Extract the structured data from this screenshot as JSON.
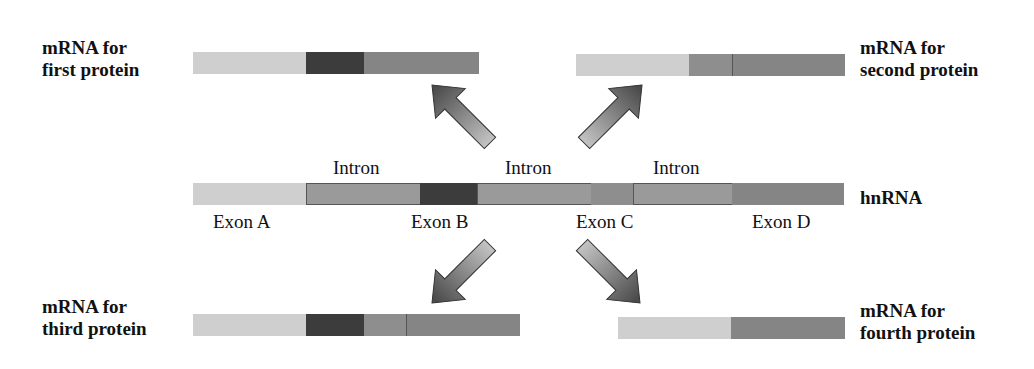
{
  "colors": {
    "exon_a": "#cfcfcf",
    "exon_b": "#3c3c3c",
    "exon_c": "#8e8e8e",
    "exon_d": "#858585",
    "intron": "#9a9a9a",
    "arrow_dark": "#4a4a4a",
    "arrow_light": "#bdbdbd"
  },
  "hnrna": {
    "label": "hnRNA",
    "intron_labels": [
      "Intron",
      "Intron",
      "Intron"
    ],
    "exon_labels": [
      "Exon A",
      "Exon B",
      "Exon C",
      "Exon D"
    ],
    "segments": [
      {
        "name": "exon-a",
        "x": 193,
        "w": 113,
        "color": "#cfcfcf"
      },
      {
        "name": "intron-1",
        "x": 306,
        "w": 114,
        "color": "#9a9a9a"
      },
      {
        "name": "exon-b",
        "x": 420,
        "w": 57,
        "color": "#3c3c3c"
      },
      {
        "name": "intron-2",
        "x": 477,
        "w": 114,
        "color": "#9a9a9a"
      },
      {
        "name": "exon-c",
        "x": 591,
        "w": 42,
        "color": "#8e8e8e"
      },
      {
        "name": "intron-3",
        "x": 633,
        "w": 99,
        "color": "#9a9a9a"
      },
      {
        "name": "exon-d",
        "x": 732,
        "w": 112,
        "color": "#858585"
      }
    ]
  },
  "mrnas": [
    {
      "id": "first",
      "label_line1": "mRNA for",
      "label_line2": "first protein",
      "exons": [
        "A",
        "B",
        "D"
      ],
      "segments": [
        {
          "x": 193,
          "w": 113,
          "color": "#cfcfcf"
        },
        {
          "x": 306,
          "w": 58,
          "color": "#3c3c3c"
        },
        {
          "x": 364,
          "w": 115,
          "color": "#858585"
        }
      ]
    },
    {
      "id": "second",
      "label_line1": "mRNA for",
      "label_line2": "second protein",
      "exons": [
        "A",
        "C",
        "D"
      ],
      "segments": [
        {
          "x": 576,
          "w": 113,
          "color": "#cfcfcf"
        },
        {
          "x": 689,
          "w": 44,
          "color": "#8e8e8e"
        },
        {
          "x": 733,
          "w": 112,
          "color": "#858585"
        }
      ]
    },
    {
      "id": "third",
      "label_line1": "mRNA for",
      "label_line2": "third protein",
      "exons": [
        "A",
        "B",
        "C",
        "D"
      ],
      "segments": [
        {
          "x": 193,
          "w": 113,
          "color": "#cfcfcf"
        },
        {
          "x": 306,
          "w": 58,
          "color": "#3c3c3c"
        },
        {
          "x": 364,
          "w": 43,
          "color": "#8e8e8e"
        },
        {
          "x": 407,
          "w": 113,
          "color": "#858585"
        }
      ]
    },
    {
      "id": "fourth",
      "label_line1": "mRNA for",
      "label_line2": "fourth protein",
      "exons": [
        "A",
        "D"
      ],
      "segments": [
        {
          "x": 618,
          "w": 113,
          "color": "#cfcfcf"
        },
        {
          "x": 731,
          "w": 114,
          "color": "#858585"
        }
      ]
    }
  ]
}
